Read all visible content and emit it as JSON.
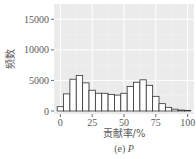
{
  "chart_data": {
    "type": "bar",
    "subtype": "histogram",
    "title": "",
    "caption_prefix": "(e) ",
    "caption_var": "P",
    "xlabel": "贡献率/%",
    "ylabel": "频数",
    "xlim": [
      -5,
      105
    ],
    "ylim": [
      0,
      17500
    ],
    "x_ticks": [
      0,
      25,
      50,
      75,
      100
    ],
    "y_ticks": [
      0,
      5000,
      10000,
      15000
    ],
    "grid": true,
    "background": "#ebebeb",
    "bar_fill": "#ffffff",
    "bar_edge": "#333333",
    "bin_width": 5,
    "bin_centers": [
      0,
      5,
      10,
      15,
      20,
      25,
      30,
      35,
      40,
      45,
      50,
      55,
      60,
      65,
      70,
      75,
      80,
      85,
      90,
      95,
      100
    ],
    "values": [
      700,
      2800,
      5200,
      5800,
      4600,
      3400,
      2900,
      2900,
      2700,
      2600,
      2900,
      4000,
      4700,
      5100,
      4200,
      2400,
      1200,
      600,
      300,
      150,
      100
    ]
  }
}
